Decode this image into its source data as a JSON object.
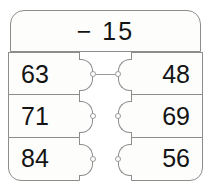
{
  "header": {
    "label": "− 15"
  },
  "columns": {
    "left": {
      "name": "left-column",
      "cells": [
        {
          "value": "63"
        },
        {
          "value": "71"
        },
        {
          "value": "84"
        }
      ]
    },
    "right": {
      "name": "right-column",
      "cells": [
        {
          "value": "48"
        },
        {
          "value": "69"
        },
        {
          "value": "56"
        }
      ]
    }
  },
  "connections": [
    {
      "from": "63",
      "to": "48"
    }
  ],
  "colors": {
    "border": "#8c8c8c",
    "text": "#141414",
    "fill": "#fdfdfc",
    "connector": "#9a9a9a"
  }
}
